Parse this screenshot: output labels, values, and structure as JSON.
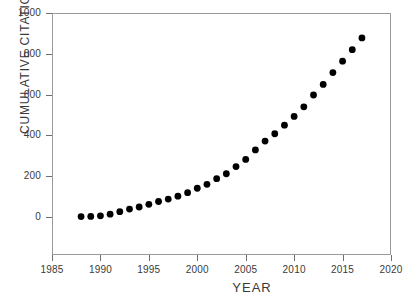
{
  "chart_data": {
    "type": "scatter",
    "title": "",
    "xlabel": "YEAR",
    "ylabel": "CUMULATIVE CITATIONS",
    "xlim": [
      1985,
      2020
    ],
    "ylim": [
      0,
      1000
    ],
    "xticks": [
      1985,
      1990,
      1995,
      2000,
      2005,
      2010,
      2015,
      2020
    ],
    "yticks": [
      0,
      200,
      400,
      600,
      800,
      1000
    ],
    "grid": false,
    "legend": "none",
    "marker": "filled-circle",
    "marker_color": "#000000",
    "frame_color": "#9a9a9a",
    "background": "#ffffff",
    "x": [
      1988,
      1989,
      1990,
      1991,
      1992,
      1993,
      1994,
      1995,
      1996,
      1997,
      1998,
      1999,
      2000,
      2001,
      2002,
      2003,
      2004,
      2005,
      2006,
      2007,
      2008,
      2009,
      2010,
      2011,
      2012,
      2013,
      2014,
      2015,
      2016,
      2017
    ],
    "values": [
      2,
      3,
      6,
      14,
      26,
      39,
      49,
      62,
      76,
      88,
      102,
      119,
      141,
      160,
      188,
      212,
      247,
      282,
      329,
      372,
      408,
      450,
      493,
      540,
      598,
      650,
      708,
      764,
      820,
      878
    ],
    "series": [
      {
        "name": "Cumulative citations",
        "values": [
          2,
          3,
          6,
          14,
          26,
          39,
          49,
          62,
          76,
          88,
          102,
          119,
          141,
          160,
          188,
          212,
          247,
          282,
          329,
          372,
          408,
          450,
          493,
          540,
          598,
          650,
          708,
          764,
          820,
          878
        ]
      }
    ]
  },
  "axes": {
    "y_tick_labels": [
      "1000",
      "800",
      "600",
      "400",
      "200",
      "0"
    ],
    "x_tick_labels": [
      "1985",
      "1990",
      "1995",
      "2000",
      "2005",
      "2010",
      "2015",
      "2020"
    ],
    "x_title": "YEAR",
    "y_title": "CUMULATIVE CITATIONS"
  }
}
